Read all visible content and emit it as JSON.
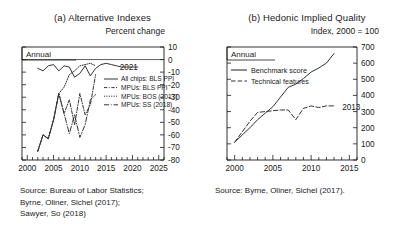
{
  "figure": {
    "width": 409,
    "height": 230,
    "background": "#ffffff",
    "ink": "#333333"
  },
  "panel_a": {
    "title": "(a) Alternative Indexes",
    "units": "Percent change",
    "frequency_label": "Annual",
    "annotation": "2021",
    "source": [
      "Source: Bureau of Labor Statistics;",
      "Byrne, Oliner, Sichel (2017);",
      "Sawyer, So (2018)"
    ]
  },
  "panel_b": {
    "title": "(b) Hedonic Implied Quality",
    "units": "Index, 2000 = 100",
    "frequency_label": "Annual",
    "annotation": "2013",
    "source": [
      "Source: Byrne, Oliner, Sichel (2017)."
    ]
  },
  "chart_data": [
    {
      "type": "line",
      "panel": "a",
      "title": "(a) Alternative Indexes",
      "xlabel": "",
      "ylabel": "Percent change",
      "xlim": [
        1999,
        2026
      ],
      "ylim": [
        -80,
        10
      ],
      "xticks": [
        2000,
        2005,
        2010,
        2015,
        2020,
        2025
      ],
      "yticks": [
        10,
        0,
        -10,
        -20,
        -30,
        -40,
        -50,
        -60,
        -70,
        -80
      ],
      "minor_xticks": 1,
      "grid": false,
      "zero_line": true,
      "legend_position": "inside-right",
      "annotations": [
        {
          "text": "2021",
          "x": 2021,
          "y": -6
        }
      ],
      "series": [
        {
          "name": "All chips: BLS PPI",
          "style": "solid",
          "x": [
            2002,
            2003,
            2004,
            2005,
            2006,
            2007,
            2008,
            2009,
            2010,
            2011,
            2012,
            2013,
            2014,
            2015,
            2016,
            2017,
            2018,
            2019,
            2020,
            2021
          ],
          "values": [
            -7,
            -9,
            -5,
            -4,
            -9,
            -5,
            -6,
            -14,
            -11,
            -5,
            -13,
            -7,
            -4,
            -3,
            -4,
            -5,
            -6,
            -6,
            -6,
            -6
          ]
        },
        {
          "name": "MPUs: BLS PPI",
          "style": "dash-dot",
          "x": [
            2002,
            2003,
            2004,
            2005,
            2006,
            2007,
            2008,
            2009,
            2010,
            2011,
            2012,
            2013
          ],
          "values": [
            -73,
            -60,
            -63,
            -48,
            -27,
            -43,
            -32,
            -52,
            -27,
            -44,
            -36,
            -12
          ]
        },
        {
          "name": "MPUs: BOS (2017)",
          "style": "dotted",
          "x": [
            2002,
            2003,
            2004,
            2005,
            2006,
            2007,
            2008,
            2009,
            2010,
            2011,
            2012,
            2013
          ],
          "values": [
            -73,
            -60,
            -63,
            -48,
            -27,
            -22,
            -12,
            -9,
            -5,
            -4,
            -3,
            -5
          ]
        },
        {
          "name": "MPUs: SS (2018)",
          "style": "long-dash-dot",
          "x": [
            2002,
            2003,
            2004,
            2005,
            2006,
            2007,
            2008,
            2009,
            2010,
            2011,
            2012,
            2013
          ],
          "values": [
            -73,
            -60,
            -63,
            -48,
            -27,
            -43,
            -59,
            -44,
            -62,
            -52,
            -32,
            -28
          ]
        }
      ]
    },
    {
      "type": "line",
      "panel": "b",
      "title": "(b) Hedonic Implied Quality",
      "xlabel": "",
      "ylabel": "Index, 2000 = 100",
      "xlim": [
        1999,
        2016
      ],
      "ylim": [
        0,
        700
      ],
      "xticks": [
        2000,
        2005,
        2010,
        2015
      ],
      "yticks": [
        0,
        100,
        200,
        300,
        400,
        500,
        600,
        700
      ],
      "minor_xticks": 1,
      "grid": false,
      "legend_position": "upper-left",
      "annotations": [
        {
          "text": "2013",
          "x": 2013.8,
          "y": 330
        }
      ],
      "series": [
        {
          "name": "Benchmark score",
          "style": "solid",
          "x": [
            2000,
            2001,
            2002,
            2003,
            2004,
            2005,
            2006,
            2007,
            2008,
            2009,
            2010,
            2011,
            2012,
            2013
          ],
          "values": [
            110,
            155,
            200,
            250,
            290,
            330,
            390,
            450,
            470,
            505,
            545,
            570,
            600,
            660
          ]
        },
        {
          "name": "Technical features",
          "style": "dashed",
          "x": [
            2000,
            2001,
            2002,
            2003,
            2004,
            2005,
            2006,
            2007,
            2008,
            2009,
            2010,
            2011,
            2012,
            2013
          ],
          "values": [
            110,
            175,
            240,
            295,
            300,
            305,
            310,
            310,
            250,
            320,
            335,
            325,
            335,
            335
          ]
        }
      ]
    }
  ],
  "legend_a": [
    {
      "label": "All chips: BLS PPI",
      "style": "solid"
    },
    {
      "label": "MPUs: BLS PPI",
      "style": "dash-dot"
    },
    {
      "label": "MPUs: BOS (2017)",
      "style": "dotted"
    },
    {
      "label": "MPUs: SS (2018)",
      "style": "long-dash-dot"
    }
  ],
  "legend_b": [
    {
      "label": "Benchmark score",
      "style": "solid"
    },
    {
      "label": "Technical features",
      "style": "dashed"
    }
  ]
}
